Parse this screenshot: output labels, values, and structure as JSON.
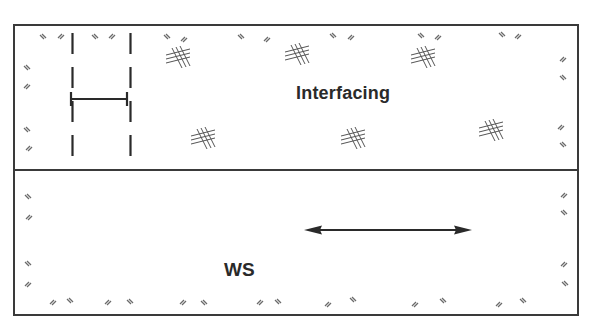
{
  "diagram": {
    "type": "sewing-pattern-layout",
    "labels": {
      "interfacing": "Interfacing",
      "wrong_side": "WS"
    },
    "colors": {
      "line": "#3a3a3a",
      "hatch": "#6a6a6a",
      "background": "#ffffff"
    },
    "layers": [
      {
        "name": "interfacing",
        "label": "Interfacing",
        "texture": "crosshatch-fusible"
      },
      {
        "name": "fabric-wrong-side",
        "label": "WS",
        "texture": "plain"
      }
    ],
    "markers": {
      "dashed_lines": 2,
      "measurement_bar": "H-shaped width marker between dashed lines",
      "grainline_arrow": "double-headed horizontal arrow"
    }
  }
}
